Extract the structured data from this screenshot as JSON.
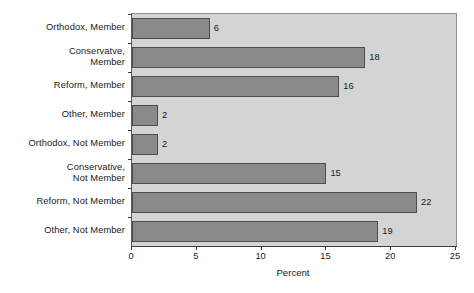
{
  "chart_data": {
    "type": "bar",
    "orientation": "horizontal",
    "title": "",
    "xlabel": "Percent",
    "ylabel": "",
    "xlim": [
      0,
      25
    ],
    "xticks": [
      0,
      5,
      10,
      15,
      20,
      25
    ],
    "xtick_labels": [
      "0",
      "5",
      "10",
      "15",
      "20",
      "25"
    ],
    "grid": false,
    "legend": null,
    "categories": [
      "Orthodox, Member",
      "Conservatve, Member",
      "Reform, Member",
      "Other, Member",
      "Orthodox, Not Member",
      "Conservative, Not Member",
      "Reform, Not Member",
      "Other, Not Member"
    ],
    "category_lines": [
      [
        "Orthodox, Member"
      ],
      [
        "Conservatve,",
        "Member"
      ],
      [
        "Reform, Member"
      ],
      [
        "Other, Member"
      ],
      [
        "Orthodox, Not Member"
      ],
      [
        "Conservative,",
        "Not Member"
      ],
      [
        "Reform, Not Member"
      ],
      [
        "Other, Not Member"
      ]
    ],
    "values": [
      6,
      18,
      16,
      2,
      2,
      15,
      22,
      19
    ],
    "value_labels": [
      "6",
      "18",
      "16",
      "2",
      "2",
      "15",
      "22",
      "19"
    ],
    "colors": {
      "bar_fill": "#8a8a8a",
      "bar_edge": "#4d4d4d",
      "plot_background": "#d4d4d4",
      "figure_background": "#ffffff",
      "axis": "#3a3a3a",
      "text": "#1a1a1a"
    }
  }
}
